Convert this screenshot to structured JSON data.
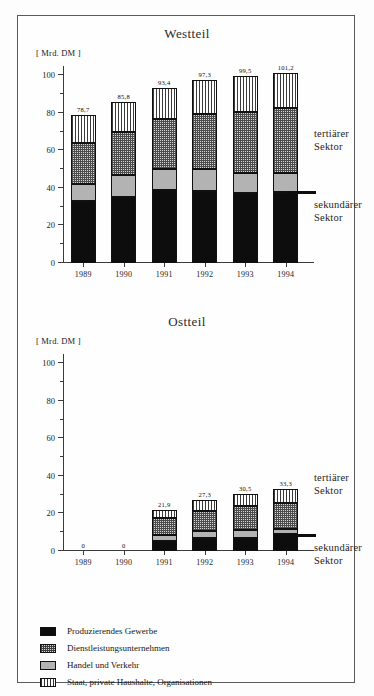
{
  "figure": {
    "unit_label": "[ Mrd. DM ]",
    "sector_tertiary": "tertiärer\nSektor",
    "sector_secondary": "sekundärer\nSektor"
  },
  "legend": {
    "items": [
      {
        "key": "s1",
        "label": "Produzierendes Gewerbe",
        "swatch": "solid-black-swatch"
      },
      {
        "key": "s2",
        "label": "Dienstleistungsunternehmen",
        "swatch": "checker-swatch"
      },
      {
        "key": "s3",
        "label": "Handel und Verkehr",
        "swatch": "solid-gray-swatch"
      },
      {
        "key": "s4",
        "label": "Staat, private Haushalte, Organisationen",
        "swatch": "vertical-stripe-swatch"
      }
    ]
  },
  "chart_data": [
    {
      "type": "bar",
      "id": "westteil",
      "title": "Westteil",
      "stacked": true,
      "xlabel": "",
      "ylabel": "[ Mrd. DM ]",
      "ylim": [
        0,
        105
      ],
      "yticks": [
        0,
        20,
        40,
        60,
        80,
        100
      ],
      "ytick_labels": [
        "0",
        "20",
        "40",
        "60",
        "80",
        "100"
      ],
      "yminor_step": 10,
      "grid": false,
      "legend_position": "below-figure",
      "categories": [
        "1989",
        "1990",
        "1991",
        "1992",
        "1993",
        "1994"
      ],
      "series": [
        {
          "name": "Produzierendes Gewerbe",
          "values": [
            33.0,
            35.2,
            38.8,
            38.4,
            37.4,
            38.0
          ]
        },
        {
          "name": "Handel und Verkehr",
          "values": [
            9.0,
            11.8,
            11.2,
            11.6,
            10.6,
            9.8
          ]
        },
        {
          "name": "Dienstleistungsunternehmen",
          "values": [
            22.0,
            23.0,
            26.8,
            29.2,
            32.6,
            34.6
          ]
        },
        {
          "name": "Staat, private Haushalte, Organisationen",
          "values": [
            14.7,
            15.8,
            16.6,
            18.1,
            18.9,
            18.8
          ]
        }
      ],
      "totals": [
        78.7,
        85.8,
        93.4,
        97.3,
        99.5,
        101.2
      ],
      "total_labels": [
        "78,7",
        "85,8",
        "93,4",
        "97,3",
        "99,5",
        "101,2"
      ],
      "annotations": [
        {
          "text": "tertiärer Sektor",
          "position": "right-upper"
        },
        {
          "text": "sekundärer Sektor",
          "position": "right-lower"
        },
        {
          "text": "divider at 38 Mrd. DM",
          "position": "right-rule"
        }
      ]
    },
    {
      "type": "bar",
      "id": "ostteil",
      "title": "Ostteil",
      "stacked": true,
      "xlabel": "",
      "ylabel": "[ Mrd. DM ]",
      "ylim": [
        0,
        105
      ],
      "yticks": [
        0,
        20,
        40,
        60,
        80,
        100
      ],
      "ytick_labels": [
        "0",
        "20",
        "40",
        "60",
        "80",
        "100"
      ],
      "yminor_step": 10,
      "grid": false,
      "legend_position": "below-figure",
      "categories": [
        "1989",
        "1990",
        "1991",
        "1992",
        "1993",
        "1994"
      ],
      "series": [
        {
          "name": "Produzierendes Gewerbe",
          "values": [
            0,
            0,
            5.4,
            6.9,
            7.0,
            9.2
          ]
        },
        {
          "name": "Handel und Verkehr",
          "values": [
            0,
            0,
            3.2,
            3.6,
            4.1,
            2.4
          ]
        },
        {
          "name": "Dienstleistungsunternehmen",
          "values": [
            0,
            0,
            8.8,
            10.9,
            12.7,
            14.2
          ]
        },
        {
          "name": "Staat, private Haushalte, Organisationen",
          "values": [
            0,
            0,
            4.5,
            5.9,
            6.7,
            7.5
          ]
        }
      ],
      "totals": [
        0,
        0,
        21.9,
        27.3,
        30.5,
        33.3
      ],
      "total_labels": [
        "0",
        "0",
        "21,9",
        "27,3",
        "30,5",
        "33,3"
      ],
      "annotations": [
        {
          "text": "tertiärer Sektor",
          "position": "right-upper"
        },
        {
          "text": "sekundärer Sektor",
          "position": "right-lower"
        },
        {
          "text": "divider at 9 Mrd. DM",
          "position": "right-rule"
        }
      ]
    }
  ]
}
